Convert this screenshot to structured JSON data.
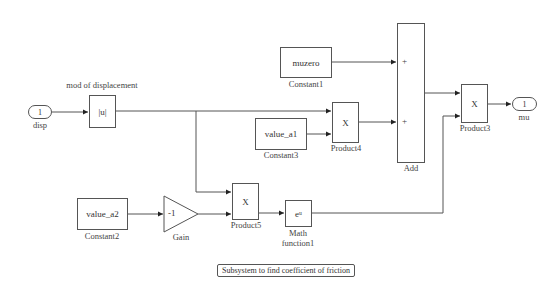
{
  "diagram": {
    "type": "simulink-subsystem",
    "annotation": "Subsystem to find coefficient of friction",
    "blocks": {
      "inport": {
        "number": "1",
        "name": "disp"
      },
      "abs": {
        "content": "|u|",
        "name": "mod of displacement"
      },
      "constant1": {
        "content": "muzero",
        "name": "Constant1"
      },
      "constant3": {
        "content": "value_a1",
        "name": "Constant3"
      },
      "product4": {
        "content": "X",
        "name": "Product4"
      },
      "add": {
        "name": "Add",
        "signs": [
          "+",
          "+"
        ]
      },
      "product3": {
        "content": "X",
        "name": "Product3"
      },
      "outport": {
        "number": "1",
        "name": "mu"
      },
      "constant2": {
        "content": "value_a2",
        "name": "Constant2"
      },
      "gain": {
        "content": "-1",
        "name": "Gain"
      },
      "product5": {
        "content": "X",
        "name": "Product5"
      },
      "math": {
        "content": "eᵘ",
        "name_line1": "Math",
        "name_line2": "function1"
      }
    },
    "connections": [
      {
        "from": "disp",
        "to": "mod of displacement"
      },
      {
        "from": "mod of displacement",
        "to": "Product4.in1"
      },
      {
        "from": "mod of displacement",
        "to": "Product5.in1"
      },
      {
        "from": "Constant3",
        "to": "Product4.in2"
      },
      {
        "from": "Constant1",
        "to": "Add.in1"
      },
      {
        "from": "Product4",
        "to": "Add.in2"
      },
      {
        "from": "Add",
        "to": "Product3.in1"
      },
      {
        "from": "Constant2",
        "to": "Gain"
      },
      {
        "from": "Gain",
        "to": "Product5.in2"
      },
      {
        "from": "Product5",
        "to": "Math function1"
      },
      {
        "from": "Math function1",
        "to": "Product3.in2"
      },
      {
        "from": "Product3",
        "to": "mu"
      }
    ]
  }
}
